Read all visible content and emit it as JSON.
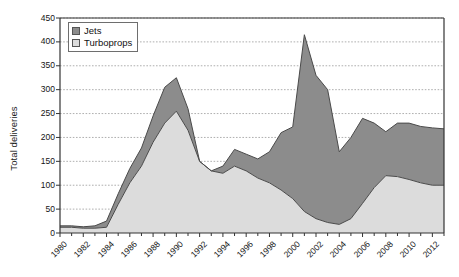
{
  "chart_data": {
    "type": "area",
    "stacked": true,
    "title": "",
    "subtitle": "",
    "xlabel": "",
    "ylabel": "Total deliveries",
    "ylim": [
      0,
      450
    ],
    "ytick_step": 50,
    "yticks": [
      0,
      50,
      100,
      150,
      200,
      250,
      300,
      350,
      400,
      450
    ],
    "grid": true,
    "grid_style": "dotted-horizontal",
    "legend_position": "top-left",
    "x": [
      1980,
      1981,
      1982,
      1983,
      1984,
      1985,
      1986,
      1987,
      1988,
      1989,
      1990,
      1991,
      1992,
      1993,
      1994,
      1995,
      1996,
      1997,
      1998,
      1999,
      2000,
      2001,
      2002,
      2003,
      2004,
      2005,
      2006,
      2007,
      2008,
      2009,
      2010,
      2011,
      2012,
      2013
    ],
    "xticks": [
      1980,
      1982,
      1984,
      1986,
      1988,
      1990,
      1992,
      1994,
      1996,
      1998,
      2000,
      2002,
      2004,
      2006,
      2008,
      2010,
      2012
    ],
    "xtick_labels": [
      "1980",
      "1982",
      "1984",
      "1986",
      "1988",
      "1990",
      "1992",
      "1994",
      "1996",
      "1998",
      "2000",
      "2002",
      "2004",
      "2006",
      "2008",
      "2010",
      "2012"
    ],
    "series": [
      {
        "name": "Turboprops",
        "color": "#dcdcdc",
        "values": [
          12,
          12,
          10,
          10,
          12,
          60,
          105,
          140,
          190,
          230,
          255,
          215,
          150,
          130,
          125,
          140,
          130,
          115,
          105,
          90,
          72,
          45,
          30,
          22,
          18,
          30,
          62,
          95,
          120,
          118,
          112,
          105,
          100,
          100
        ]
      },
      {
        "name": "Jets",
        "color": "#8c8c8c",
        "values": [
          3,
          3,
          3,
          5,
          13,
          22,
          30,
          38,
          55,
          75,
          70,
          45,
          0,
          0,
          15,
          35,
          35,
          40,
          65,
          120,
          150,
          370,
          300,
          278,
          152,
          170,
          178,
          135,
          92,
          112,
          118,
          118,
          120,
          118
        ]
      }
    ],
    "totals": [
      15,
      15,
      13,
      15,
      25,
      82,
      135,
      178,
      245,
      305,
      325,
      260,
      150,
      130,
      140,
      175,
      165,
      155,
      170,
      210,
      222,
      415,
      330,
      300,
      170,
      200,
      240,
      230,
      212,
      230,
      230,
      223,
      220,
      218
    ]
  },
  "legend": {
    "items": [
      {
        "label": "Jets",
        "color": "#8c8c8c"
      },
      {
        "label": "Turboprops",
        "color": "#dcdcdc"
      }
    ]
  },
  "axis": {
    "ylabel": "Total deliveries"
  }
}
